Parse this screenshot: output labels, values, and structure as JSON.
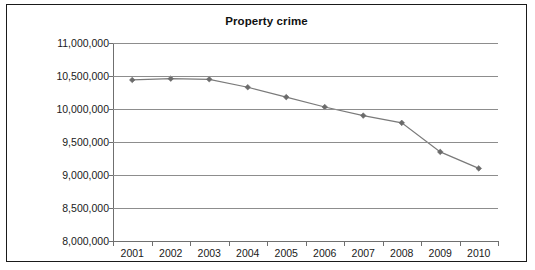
{
  "chart_data": {
    "type": "line",
    "title": "Property crime",
    "xlabel": "",
    "ylabel": "",
    "categories": [
      "2001",
      "2002",
      "2003",
      "2004",
      "2005",
      "2006",
      "2007",
      "2008",
      "2009",
      "2010"
    ],
    "x": [
      2001,
      2002,
      2003,
      2004,
      2005,
      2006,
      2007,
      2008,
      2009,
      2010
    ],
    "values": [
      10440000,
      10460000,
      10450000,
      10330000,
      10180000,
      10030000,
      9900000,
      9790000,
      9350000,
      9100000
    ],
    "series": [
      {
        "name": "Property crime",
        "values": [
          10440000,
          10460000,
          10450000,
          10330000,
          10180000,
          10030000,
          9900000,
          9790000,
          9350000,
          9100000
        ]
      }
    ],
    "ylim": [
      8000000,
      11000000
    ],
    "ytick_values": [
      8000000,
      8500000,
      9000000,
      9500000,
      10000000,
      10500000,
      11000000
    ],
    "ytick_labels": [
      "8,000,000",
      "8,500,000",
      "9,000,000",
      "9,500,000",
      "10,000,000",
      "10,500,000",
      "11,000,000"
    ],
    "grid": true,
    "grid_axis": "y",
    "legend": false,
    "legend_position": "none",
    "marker": "diamond",
    "line_color": "#7a7a7a",
    "marker_color": "#6b6b6b",
    "grid_color": "#8d8d8d",
    "axis_color": "#6f6f6f",
    "text_color": "#1a1a1a",
    "border_color": "#1a1a1a",
    "background_color": "#ffffff"
  }
}
